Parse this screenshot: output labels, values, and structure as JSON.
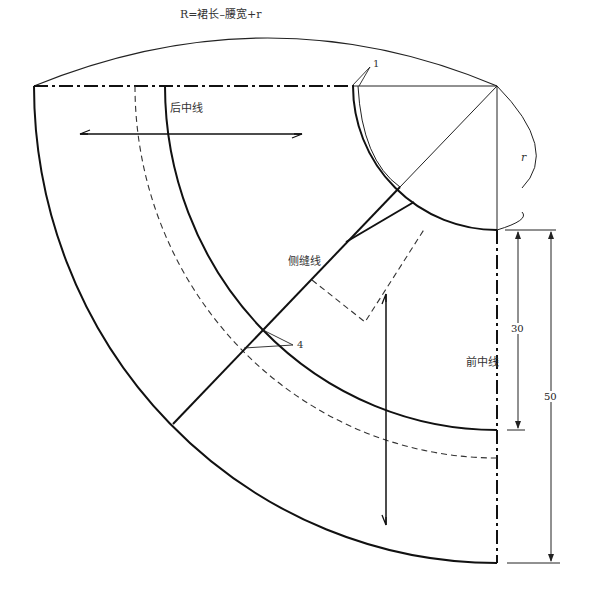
{
  "labels": {
    "radius_formula": "R=裙长–腰宽+r",
    "back_center": "后中线",
    "side_seam": "侧缝线",
    "front_center": "前中线",
    "r_mark": "r",
    "marker_1": "1",
    "marker_4": "4"
  },
  "dimensions": {
    "upper": "30",
    "total": "50"
  }
}
